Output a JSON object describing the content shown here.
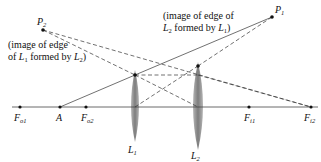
{
  "diagram": {
    "type": "thin-lens-system-ray-diagram",
    "optical_axis": {
      "x1": 12,
      "x2": 318,
      "y": 107
    },
    "lenses": [
      {
        "id": "L1",
        "label": "L",
        "sub": "1",
        "x": 135,
        "top": 70,
        "bottom": 142,
        "edge_point": [
          135,
          75
        ],
        "label_pos": [
          128,
          153
        ]
      },
      {
        "id": "L2",
        "label": "L",
        "sub": "2",
        "x": 198,
        "top": 62,
        "bottom": 150,
        "edge_point": [
          198,
          66
        ],
        "label_pos": [
          191,
          160
        ]
      }
    ],
    "points": [
      {
        "id": "Fo1",
        "label": "F",
        "sub": "o1",
        "pos": [
          20,
          107
        ],
        "label_pos": [
          14,
          121
        ]
      },
      {
        "id": "A",
        "label": "A",
        "sub": "",
        "pos": [
          60,
          107
        ],
        "label_pos": [
          56,
          121
        ]
      },
      {
        "id": "Fo2",
        "label": "F",
        "sub": "o2",
        "pos": [
          86,
          107
        ],
        "label_pos": [
          81,
          121
        ]
      },
      {
        "id": "Fi1",
        "label": "F",
        "sub": "i1",
        "pos": [
          249,
          107
        ],
        "label_pos": [
          244,
          121
        ]
      },
      {
        "id": "Fi2",
        "label": "F",
        "sub": "i2",
        "pos": [
          311,
          107
        ],
        "label_pos": [
          304,
          121
        ]
      },
      {
        "id": "P1",
        "label": "P",
        "sub": "1",
        "pos": [
          272,
          17
        ],
        "label_pos": [
          275,
          13
        ]
      },
      {
        "id": "P2",
        "label": "P",
        "sub": "2",
        "pos": [
          43,
          30
        ],
        "label_pos": [
          37,
          25
        ]
      }
    ],
    "annotations": {
      "p2_note_line1": "(image of edge",
      "p2_note_line2_a": "of ",
      "p2_note_line2_L": "L",
      "p2_note_line2_Lsub": "1",
      "p2_note_line2_b": " formed by ",
      "p2_note_line2_L2": "L",
      "p2_note_line2_L2sub": "2",
      "p2_note_line2_c": ")",
      "p1_note_line1": "(image of edge of",
      "p1_note_line2_L": "L",
      "p1_note_line2_Lsub": "2",
      "p1_note_line2_b": " formed by ",
      "p1_note_line2_L1": "L",
      "p1_note_line2_L1sub": "1",
      "p1_note_line2_c": ")"
    },
    "colors": {
      "lens_fill": "#8c8c8c",
      "line": "#333333",
      "axis": "#444444"
    }
  }
}
